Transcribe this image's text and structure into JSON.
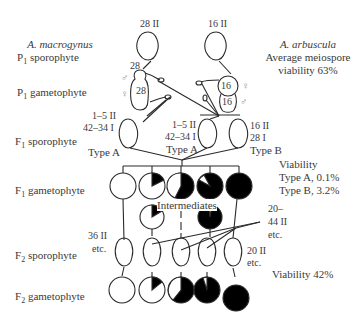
{
  "left_labels": {
    "species_a": "A. macrogynus",
    "p1_sporophyte": "P",
    "p1_sporophyte_sub": "1",
    "p1_sporophyte_rest": " sporophyte",
    "p1_gametophyte": "P",
    "p1_gametophyte_sub": "1",
    "p1_gametophyte_rest": " gametophyte",
    "f1_sporophyte": "F",
    "f1_sporophyte_sub": "1",
    "f1_sporophyte_rest": " sporophyte",
    "f1_gametophyte": "F",
    "f1_gametophyte_sub": "1",
    "f1_gametophyte_rest": " gametophyte",
    "f2_sporophyte": "F",
    "f2_sporophyte_sub": "2",
    "f2_sporophyte_rest": " sporophyte",
    "f2_gametophyte": "F",
    "f2_gametophyte_sub": "2",
    "f2_gametophyte_rest": " gametophyte"
  },
  "right_labels": {
    "species_b": "A. arbuscula",
    "viability_line1": "Average meiospore",
    "viability_line2": "viability 63%",
    "f1_viability_title": "Viability",
    "f1_viability_a": "Type A, 0.1%",
    "f1_viability_b": "Type B, 3.2%",
    "f2_viability": "Viability 42%"
  },
  "parents": {
    "a_chromosomes": "28 II",
    "b_chromosomes": "16 II",
    "a_gamete_count": "28",
    "a_gamete_inner": "28",
    "b_gamete_top": "16",
    "b_gamete_bottom": "16",
    "male_symbol": "♂",
    "female_symbol": "♀"
  },
  "f1": {
    "type_a_left_line1": "1–5 II",
    "type_a_left_line2": "42–34 I",
    "type_a_left_name": "Type A",
    "type_a_mid_line1": "1–5 II",
    "type_a_mid_line2": "42–34 I",
    "type_a_mid_name": "Type A",
    "type_b_line1": "16 II",
    "type_b_line2": "28 I",
    "type_b_name": "Type B",
    "intermediates": "Intermediates"
  },
  "f2": {
    "left_line1": "36 II",
    "left_line2": "etc.",
    "mid_line1": "20–",
    "mid_line2": "44 II",
    "mid_line3": "etc.",
    "right_line1": "20 II",
    "right_line2": "etc."
  },
  "colors": {
    "stroke": "#2a2a2a",
    "fill_dark": "#000000",
    "text": "#3a3a3a"
  }
}
